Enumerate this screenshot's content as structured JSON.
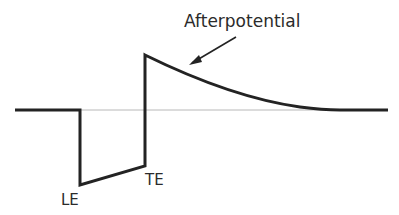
{
  "diagram": {
    "labels": {
      "afterpotential": "Afterpotential",
      "leading_edge": "LE",
      "trailing_edge": "TE"
    },
    "colors": {
      "waveform": "#232323",
      "baseline": "#b8b8b8",
      "text": "#2b2b2b"
    }
  }
}
